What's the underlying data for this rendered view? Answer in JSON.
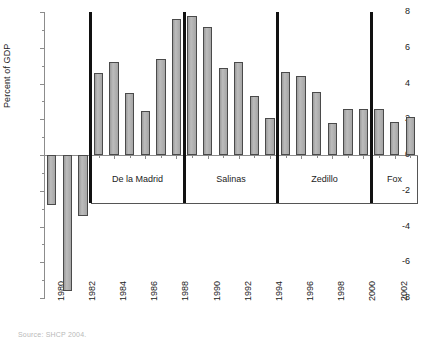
{
  "chart_data": {
    "type": "bar",
    "title": "",
    "subtitle": "",
    "xlabel": "",
    "ylabel": "Percent of GDP",
    "ylim": [
      -8,
      8
    ],
    "yticks": [
      8,
      6,
      4,
      2,
      0,
      -2,
      -4,
      -6,
      -8
    ],
    "ytick_labels": [
      "8",
      "6",
      "4",
      "2",
      "0",
      "-2",
      "-4",
      "-6",
      "-8"
    ],
    "grid": false,
    "legend": "none",
    "x": [
      1980,
      1981,
      1982,
      1983,
      1984,
      1985,
      1986,
      1987,
      1988,
      1989,
      1990,
      1991,
      1992,
      1993,
      1994,
      1995,
      1996,
      1997,
      1998,
      1999,
      2000,
      2001,
      2002,
      2003
    ],
    "xtick_labels": [
      "1980",
      "1982",
      "1984",
      "1986",
      "1988",
      "1990",
      "1992",
      "1994",
      "1996",
      "1998",
      "2000",
      "2002"
    ],
    "xtick_years": [
      1980,
      1982,
      1984,
      1986,
      1988,
      1990,
      1992,
      1994,
      1996,
      1998,
      2000,
      2002
    ],
    "values": [
      -2.8,
      -7.6,
      -3.4,
      4.6,
      5.2,
      3.45,
      2.45,
      5.35,
      7.6,
      7.8,
      7.15,
      4.85,
      5.2,
      3.3,
      2.05,
      4.65,
      4.4,
      3.5,
      1.8,
      2.55,
      2.55,
      2.55,
      1.85,
      2.15
    ],
    "series": [
      {
        "name": "Primary balance",
        "values": [
          -2.8,
          -7.6,
          -3.4,
          4.6,
          5.2,
          3.45,
          2.45,
          5.35,
          7.6,
          7.8,
          7.15,
          4.85,
          5.2,
          3.3,
          2.05,
          4.65,
          4.4,
          3.5,
          1.8,
          2.55,
          2.55,
          2.55,
          1.85,
          2.15
        ]
      }
    ],
    "annotations": {
      "period_bands": [
        {
          "label": "De la Madrid",
          "start_year": 1983,
          "end_year": 1988
        },
        {
          "label": "Salinas",
          "start_year": 1989,
          "end_year": 1994
        },
        {
          "label": "Zedillo",
          "start_year": 1995,
          "end_year": 2000
        },
        {
          "label": "Fox",
          "start_year": 2001,
          "end_year": 2003
        }
      ],
      "divider_years": [
        1983,
        1989,
        1995,
        2001
      ]
    },
    "colors": {
      "bar_fill": "#a8a8a8",
      "bar_edge": "#4a4a4a",
      "axis": "#8c8c8c",
      "divider": "#111111",
      "text": "#222222",
      "background": "#ffffff"
    }
  },
  "footnote": "Source: SHCP 2004."
}
